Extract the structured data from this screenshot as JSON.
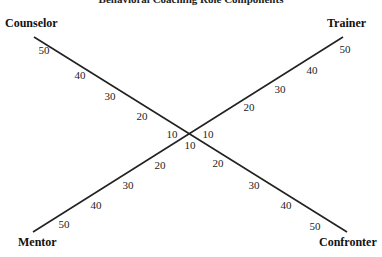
{
  "title": "Behavioral Coaching Role Components",
  "poles": {
    "top_left": "Counselor",
    "top_right": "Trainer",
    "bottom_left": "Mentor",
    "bottom_right": "Confronter"
  },
  "axes": [
    {
      "name": "Counselor-Confronter axis",
      "from": "Counselor",
      "to": "Confronter"
    },
    {
      "name": "Trainer-Mentor axis",
      "from": "Trainer",
      "to": "Mentor"
    }
  ],
  "scale": {
    "counselor": [
      "50",
      "40",
      "30",
      "20",
      "10"
    ],
    "trainer": [
      "50",
      "40",
      "30",
      "20",
      "10"
    ],
    "mentor": [
      "50",
      "40",
      "30",
      "20"
    ],
    "confronter": [
      "50",
      "40",
      "30",
      "20"
    ],
    "center_bottom": "10"
  },
  "colors": {
    "line": "#222222",
    "text": "#111111",
    "background": "#ffffff"
  }
}
